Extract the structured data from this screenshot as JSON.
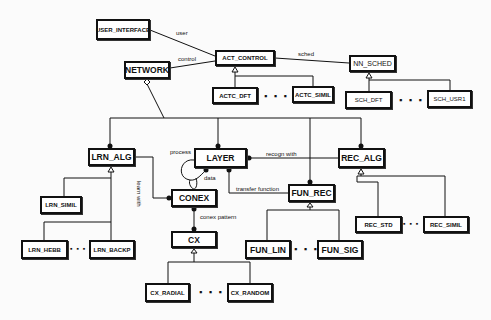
{
  "diagram": {
    "boxes": {
      "user_interface": "USER_INTERFACE",
      "act_control": "ACT_CONTROL",
      "network": "NETWORK",
      "nn_sched": "NN_SCHED",
      "actc_dft": "ACTC_DFT",
      "actc_simil": "ACTC_SIMIL",
      "sch_dft": "SCH_DFT",
      "sch_usr1": "SCH_USR1",
      "lrn_alg": "LRN_ALG",
      "layer": "LAYER",
      "rec_alg": "REC_ALG",
      "conex": "CONEX",
      "fun_rec": "FUN_REC",
      "lrn_simil": "LRN_SIMIL",
      "lrn_hebb": "LRN_HEBB",
      "lrn_backp": "LRN_BACKP",
      "cx": "CX",
      "fun_lin": "FUN_LIN",
      "fun_sig": "FUN_SIG",
      "rec_std": "REC_STD",
      "rec_simil": "REC_SIMIL",
      "cx_radial": "CX_RADIAL",
      "cx_random": "CX_RANDOM"
    },
    "labels": {
      "user": "user",
      "control": "control",
      "sched": "sched",
      "process": "process",
      "data": "data",
      "recogn_with": "recogn with",
      "learn_with": "learn with",
      "transfer_function": "transfer function",
      "conex_pattern": "conex pattern"
    },
    "ellipsis": "▪ ▪ ▪"
  }
}
